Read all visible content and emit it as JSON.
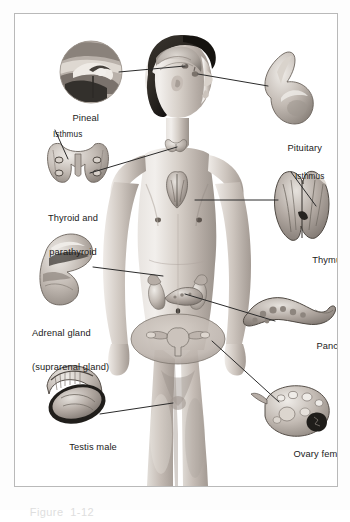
{
  "figure": {
    "caption_fragment": "Figure  1-12",
    "border_color": "#b9b9b9",
    "background_color": "#ffffff",
    "text_color": "#1a1a1a",
    "leader_line_color": "#2b2b2b"
  },
  "body_figure": {
    "name": "human-figure-anterior-view",
    "description": "Anterior view of a human body with endocrine organs shown in place",
    "skin_tone": "#cfc7c0",
    "hair_color": "#2a2622"
  },
  "labels": [
    {
      "id": "pineal",
      "text": "Pineal",
      "side": "left",
      "x": 60,
      "y": 88,
      "align": "center",
      "size": "normal",
      "inset_shape": "circle-brain-midsagittal"
    },
    {
      "id": "isthmus-thyroid",
      "text": "Isthmus",
      "side": "left",
      "x": 20,
      "y": 108,
      "align": "left",
      "size": "small",
      "inset_shape": "pointer-to-thyroid-isthmus"
    },
    {
      "id": "thyroid-parathyroid",
      "text": "Thyroid and\nparathyroid",
      "line1": "Thyroid and",
      "line2": "parathyroid",
      "side": "left",
      "x": 27,
      "y": 178,
      "align": "center",
      "size": "normal",
      "inset_shape": "thyroid-butterfly"
    },
    {
      "id": "adrenal-gland",
      "text": "Adrenal gland\n(suprarenal gland)",
      "line1": "Adrenal gland",
      "line2": "(suprarenal gland)",
      "side": "left",
      "x": 18,
      "y": 294,
      "align": "left",
      "size": "normal",
      "inset_shape": "adrenal-cap"
    },
    {
      "id": "testis-male",
      "text": "Testis male",
      "side": "left",
      "x": 34,
      "y": 418,
      "align": "left",
      "size": "normal",
      "inset_shape": "testis-epididymis"
    },
    {
      "id": "pituitary",
      "text": "Pituitary",
      "side": "right",
      "x": 252,
      "y": 119,
      "align": "left",
      "size": "normal",
      "inset_shape": "pituitary-gland"
    },
    {
      "id": "isthmus-thymus",
      "text": "Isthmus",
      "side": "right",
      "x": 262,
      "y": 150,
      "align": "left",
      "size": "small",
      "inset_shape": "pointer-to-thymus-isthmus"
    },
    {
      "id": "thymus",
      "text": "Thymus",
      "side": "right",
      "x": 277,
      "y": 231,
      "align": "left",
      "size": "normal",
      "inset_shape": "thymus-bilobed"
    },
    {
      "id": "pancreas",
      "text": "Pancreas",
      "side": "right",
      "x": 281,
      "y": 317,
      "align": "left",
      "size": "normal",
      "inset_shape": "pancreas-elongated"
    },
    {
      "id": "ovary-female",
      "text": "Ovary female",
      "side": "right",
      "x": 258,
      "y": 425,
      "align": "left",
      "size": "normal",
      "inset_shape": "ovary-follicles"
    }
  ],
  "organs_in_body": [
    {
      "id": "pineal-site",
      "name": "pineal-gland-in-brain"
    },
    {
      "id": "pituitary-site",
      "name": "pituitary-gland-in-brain"
    },
    {
      "id": "thyroid-site",
      "name": "thyroid-gland-at-neck"
    },
    {
      "id": "thymus-site",
      "name": "thymus-behind-sternum"
    },
    {
      "id": "adrenal-site",
      "name": "adrenal-glands-atop-kidneys"
    },
    {
      "id": "pancreas-site",
      "name": "pancreas-in-abdomen"
    },
    {
      "id": "ovary-site",
      "name": "ovaries-and-uterus-in-pelvis"
    },
    {
      "id": "testis-site",
      "name": "testes-in-scrotum"
    }
  ],
  "leader_lines": [
    {
      "id": "pineal-leader",
      "from": [
        104,
        58
      ],
      "to": [
        170,
        52
      ]
    },
    {
      "id": "pituitary-leader",
      "from": [
        253,
        72
      ],
      "to": [
        183,
        60
      ]
    },
    {
      "id": "thyroid-leader",
      "from": [
        75,
        159
      ],
      "to": [
        162,
        133
      ]
    },
    {
      "id": "thymus-leader",
      "from": [
        263,
        186
      ],
      "to": [
        180,
        186
      ]
    },
    {
      "id": "adrenal-leader",
      "from": [
        78,
        253
      ],
      "to": [
        148,
        262
      ]
    },
    {
      "id": "pancreas-leader",
      "from": [
        260,
        307
      ],
      "to": [
        170,
        280
      ]
    },
    {
      "id": "ovary-leader",
      "from": [
        264,
        388
      ],
      "to": [
        197,
        327
      ]
    },
    {
      "id": "testis-leader",
      "from": [
        85,
        400
      ],
      "to": [
        158,
        389
      ]
    },
    {
      "id": "isthmus-thyroid-leader",
      "from": [
        40,
        116
      ],
      "to": [
        52,
        144
      ]
    },
    {
      "id": "isthmus-thymus-leader",
      "from": [
        276,
        158
      ],
      "to": [
        300,
        190
      ]
    }
  ]
}
